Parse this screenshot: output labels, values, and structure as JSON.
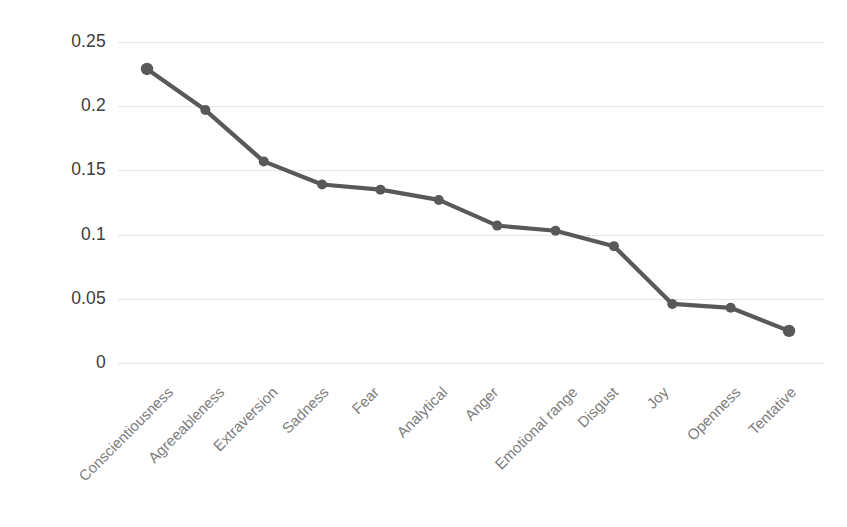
{
  "chart_data": {
    "type": "line",
    "title": "",
    "subtitle": "",
    "xlabel": "",
    "ylabel": "",
    "categories": [
      "Conscientiousness",
      "Agreeableness",
      "Extraversion",
      "Sadness",
      "Fear",
      "Analytical",
      "Anger",
      "Emotional range",
      "Disgust",
      "Joy",
      "Openness",
      "Tentative"
    ],
    "values": [
      0.229,
      0.197,
      0.157,
      0.139,
      0.135,
      0.127,
      0.107,
      0.103,
      0.091,
      0.046,
      0.043,
      0.025
    ],
    "series": [
      {
        "name": "",
        "values": [
          0.229,
          0.197,
          0.157,
          0.139,
          0.135,
          0.127,
          0.107,
          0.103,
          0.091,
          0.046,
          0.043,
          0.025
        ]
      }
    ],
    "ylim": [
      0,
      0.25
    ],
    "ytick_labels": [
      "0.25",
      "0.2",
      "0.15",
      "0.1",
      "0.05",
      "0"
    ],
    "ytick_values": [
      0.25,
      0.2,
      0.15,
      0.1,
      0.05,
      0
    ],
    "grid": true,
    "grid_axis": "y",
    "legend": false,
    "legend_position": "none",
    "marker": "circle",
    "line_color": "#595959",
    "marker_color": "#595959",
    "grid_color": "#e6e6e6",
    "tick_label_color": "#3d3d3d",
    "category_label_color": "#7d7d7d",
    "category_label_rotation": -45,
    "background_color": "#ffffff",
    "annotations": []
  }
}
